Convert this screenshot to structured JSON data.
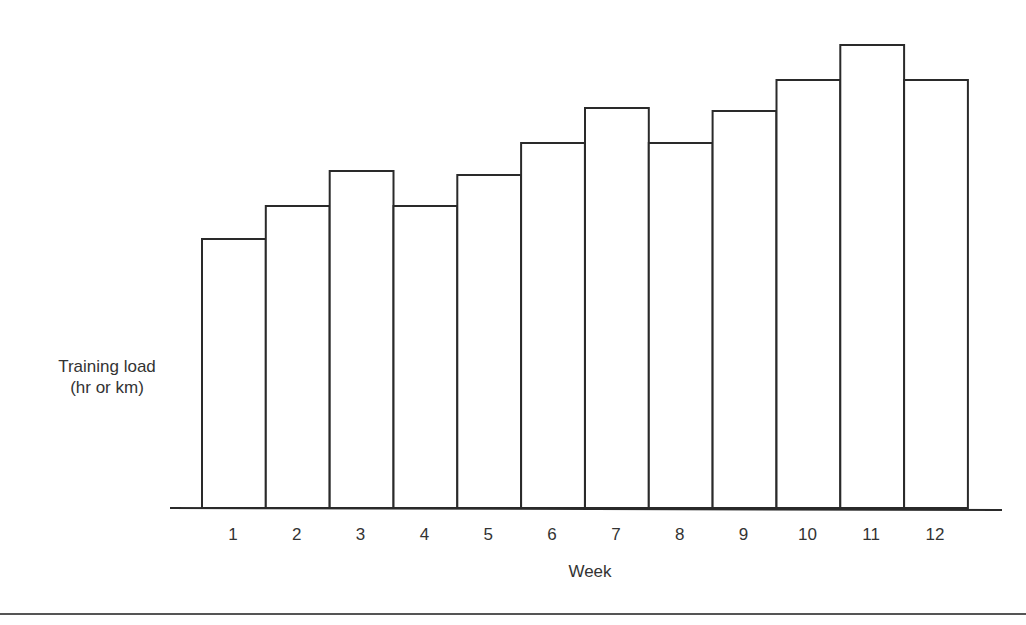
{
  "chart_data": {
    "type": "bar",
    "title": "",
    "xlabel": "Week",
    "ylabel": "Training load\n(hr or km)",
    "ylabel_lines": [
      "Training load",
      "(hr or km)"
    ],
    "categories": [
      "1",
      "2",
      "3",
      "4",
      "5",
      "6",
      "7",
      "8",
      "9",
      "10",
      "11",
      "12"
    ],
    "values": [
      269,
      302,
      337,
      302,
      333,
      365,
      400,
      365,
      397,
      428,
      463,
      428
    ],
    "value_units": "relative (no y-axis scale shown)",
    "ylim": [
      0,
      480
    ],
    "grid": false,
    "legend": null,
    "bar_fill": "#ffffff",
    "bar_stroke": "#2a2a2a"
  }
}
